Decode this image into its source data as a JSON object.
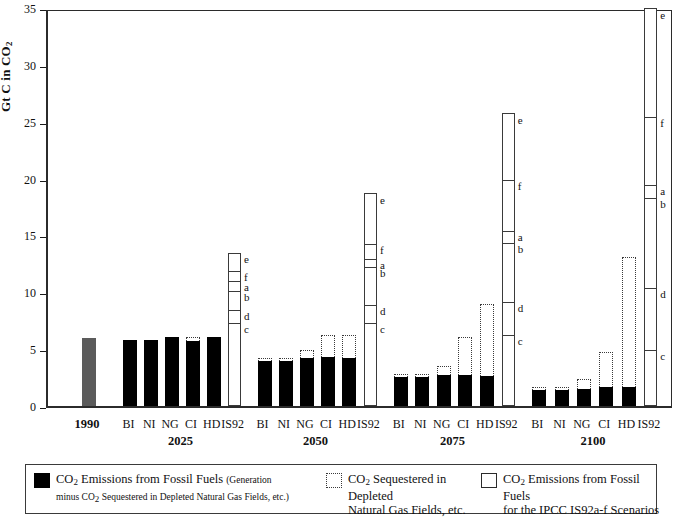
{
  "chart_data": {
    "type": "bar",
    "title": "",
    "xlabel": "",
    "ylabel": "Gt C in CO2",
    "ylabel_parts": {
      "main": "Gt C in CO",
      "sub": "2"
    },
    "ylim": [
      0,
      35
    ],
    "yticks": [
      0,
      5,
      10,
      15,
      20,
      25,
      30,
      35
    ],
    "grid": false,
    "legend_position": "bottom",
    "series_labels": [
      "BI",
      "NI",
      "NG",
      "CI",
      "HD"
    ],
    "is92_label": "IS92",
    "is92_segments": [
      "e",
      "f",
      "a",
      "b",
      "d",
      "c"
    ],
    "groups": [
      {
        "group": "1990",
        "bars": [
          {
            "label": "1990",
            "fossil": 6.0,
            "sequestered_top": 6.0,
            "style": "gray"
          }
        ],
        "is92": null
      },
      {
        "group": "2025",
        "bars": [
          {
            "label": "BI",
            "fossil": 5.8,
            "sequestered_top": 5.8
          },
          {
            "label": "NI",
            "fossil": 5.8,
            "sequestered_top": 5.8
          },
          {
            "label": "NG",
            "fossil": 6.1,
            "sequestered_top": 6.1
          },
          {
            "label": "CI",
            "fossil": 6.0,
            "sequestered_top": 6.35
          },
          {
            "label": "HD",
            "fossil": 6.1,
            "sequestered_top": 6.1
          }
        ],
        "is92": {
          "top": 13.5,
          "segments": {
            "e": 13.5,
            "f": 12.0,
            "a": 11.1,
            "b": 10.2,
            "d": 8.5,
            "c": 7.4
          }
        }
      },
      {
        "group": "2050",
        "bars": [
          {
            "label": "BI",
            "fossil": 4.2,
            "sequestered_top": 4.45
          },
          {
            "label": "NI",
            "fossil": 4.2,
            "sequestered_top": 4.45
          },
          {
            "label": "NG",
            "fossil": 4.5,
            "sequestered_top": 5.2
          },
          {
            "label": "CI",
            "fossil": 4.6,
            "sequestered_top": 6.5
          },
          {
            "label": "HD",
            "fossil": 4.5,
            "sequestered_top": 6.5
          }
        ],
        "is92": {
          "top": 18.7,
          "segments": {
            "e": 18.7,
            "f": 14.3,
            "a": 13.0,
            "b": 12.3,
            "d": 9.0,
            "c": 7.4
          }
        }
      },
      {
        "group": "2075",
        "bars": [
          {
            "label": "BI",
            "fossil": 2.8,
            "sequestered_top": 3.05
          },
          {
            "label": "NI",
            "fossil": 2.8,
            "sequestered_top": 3.05
          },
          {
            "label": "NG",
            "fossil": 3.0,
            "sequestered_top": 3.75
          },
          {
            "label": "CI",
            "fossil": 3.0,
            "sequestered_top": 6.3
          },
          {
            "label": "HD",
            "fossil": 2.9,
            "sequestered_top": 9.2
          }
        ],
        "is92": {
          "top": 25.8,
          "segments": {
            "e": 25.8,
            "f": 20.0,
            "a": 15.5,
            "b": 14.4,
            "d": 9.2,
            "c": 6.3
          }
        }
      },
      {
        "group": "2100",
        "bars": [
          {
            "label": "BI",
            "fossil": 1.7,
            "sequestered_top": 1.95
          },
          {
            "label": "NI",
            "fossil": 1.7,
            "sequestered_top": 1.95
          },
          {
            "label": "NG",
            "fossil": 1.8,
            "sequestered_top": 2.6
          },
          {
            "label": "CI",
            "fossil": 1.9,
            "sequestered_top": 5.0
          },
          {
            "label": "HD",
            "fossil": 1.9,
            "sequestered_top": 13.4
          }
        ],
        "is92": {
          "top": 35.0,
          "segments": {
            "e": 35.0,
            "f": 25.5,
            "a": 19.5,
            "b": 18.4,
            "d": 10.5,
            "c": 5.0
          }
        }
      }
    ]
  },
  "legend": {
    "items": [
      {
        "swatch": "black",
        "line1": "CO2 Emissions from Fossil Fuels",
        "line1_paren": "(Generation",
        "line2": "minus CO2 Sequestered in Depleted Natural Gas Fields, etc.)"
      },
      {
        "swatch": "dotted",
        "line1": "CO2 Sequestered in Depleted",
        "line2": "Natural Gas Fields, etc."
      },
      {
        "swatch": "open",
        "line1": "CO2 Emissions from Fossil Fuels",
        "line2": "for the IPCC IS92a-f Scenarios"
      }
    ]
  },
  "caption": ""
}
